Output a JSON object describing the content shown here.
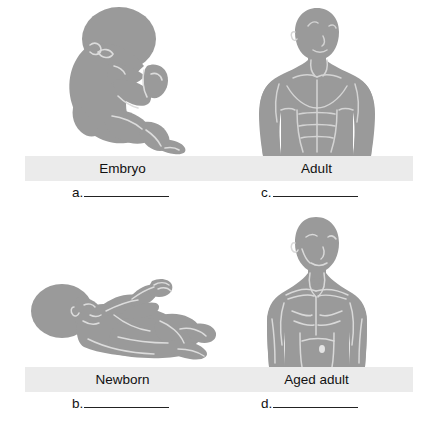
{
  "figure": {
    "background_color": "#ffffff",
    "caption_band_color": "#ebebeb",
    "silhouette_color": "#9a9a9a",
    "silhouette_detail_color": "#d8d8d8",
    "text_color": "#111111",
    "rule_color": "#222222"
  },
  "stages": [
    {
      "id": "embryo",
      "caption": "Embryo",
      "blank_letter": "a.",
      "blank_value": "",
      "icon": "embryo-silhouette-icon",
      "position": "top-left"
    },
    {
      "id": "adult",
      "caption": "Adult",
      "blank_letter": "c.",
      "blank_value": "",
      "icon": "adult-torso-silhouette-icon",
      "position": "top-right"
    },
    {
      "id": "newborn",
      "caption": "Newborn",
      "blank_letter": "b.",
      "blank_value": "",
      "icon": "newborn-silhouette-icon",
      "position": "bottom-left"
    },
    {
      "id": "aged-adult",
      "caption": "Aged adult",
      "blank_letter": "d.",
      "blank_value": "",
      "icon": "aged-adult-torso-silhouette-icon",
      "position": "bottom-right"
    }
  ]
}
